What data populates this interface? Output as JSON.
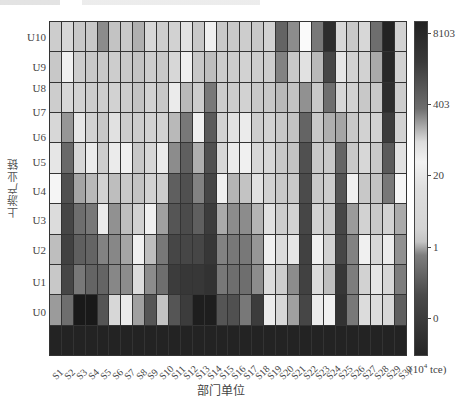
{
  "chart_data": {
    "type": "heatmap",
    "title": "",
    "xlabel": "部门单位",
    "ylabel": "上游产业链",
    "colorbar": {
      "unit": "(10⁴ tce)",
      "ticks": [
        "8103",
        "403",
        "20",
        "1",
        "0"
      ],
      "gradient": [
        {
          "pos": 0,
          "color": "#222222"
        },
        {
          "pos": 0.12,
          "color": "#3a3a3a"
        },
        {
          "pos": 0.26,
          "color": "#6e6e6e"
        },
        {
          "pos": 0.36,
          "color": "#dcdcdc"
        },
        {
          "pos": 0.42,
          "color": "#f2f2f2"
        },
        {
          "pos": 0.5,
          "color": "#dedede"
        },
        {
          "pos": 0.62,
          "color": "#d4d4d4"
        },
        {
          "pos": 0.66,
          "color": "#c4c4c4"
        },
        {
          "pos": 0.7,
          "color": "#7e7e7e"
        },
        {
          "pos": 0.82,
          "color": "#4a4a4a"
        },
        {
          "pos": 1,
          "color": "#252525"
        }
      ]
    },
    "x_categories": [
      "S1",
      "S2",
      "S3",
      "S4",
      "S5",
      "S6",
      "S7",
      "S8",
      "S9",
      "S10",
      "S11",
      "S12",
      "S13",
      "S14",
      "S15",
      "S16",
      "S17",
      "S18",
      "S19",
      "S20",
      "S21",
      "S22",
      "S23",
      "S24",
      "S25",
      "S26",
      "S27",
      "S28",
      "S29",
      "S30"
    ],
    "y_categories": [
      "U10",
      "U9",
      "U8",
      "U7",
      "U6",
      "U5",
      "U4",
      "U3",
      "U2",
      "U1",
      "U0"
    ],
    "cell_grey_levels_note": "rows top-to-bottom (11 grid bands, last band all dark), values are grey level 0-255",
    "grey_levels": [
      [
        205,
        215,
        200,
        200,
        140,
        195,
        200,
        175,
        215,
        205,
        210,
        225,
        200,
        240,
        200,
        200,
        205,
        200,
        210,
        100,
        140,
        250,
        120,
        45,
        215,
        200,
        215,
        110,
        35,
        210
      ],
      [
        200,
        240,
        205,
        200,
        200,
        205,
        200,
        195,
        205,
        200,
        215,
        240,
        200,
        190,
        205,
        205,
        210,
        205,
        205,
        130,
        200,
        225,
        185,
        70,
        230,
        210,
        210,
        170,
        40,
        210
      ],
      [
        205,
        215,
        210,
        205,
        205,
        210,
        205,
        195,
        210,
        200,
        235,
        185,
        205,
        120,
        205,
        205,
        210,
        200,
        200,
        185,
        195,
        145,
        200,
        110,
        215,
        210,
        200,
        200,
        45,
        205
      ],
      [
        215,
        150,
        230,
        210,
        200,
        225,
        205,
        205,
        210,
        210,
        185,
        120,
        240,
        90,
        210,
        225,
        235,
        205,
        210,
        200,
        195,
        100,
        200,
        175,
        165,
        200,
        210,
        210,
        60,
        210
      ],
      [
        230,
        105,
        215,
        235,
        205,
        235,
        240,
        200,
        215,
        235,
        140,
        95,
        175,
        80,
        215,
        235,
        240,
        215,
        215,
        200,
        195,
        80,
        200,
        200,
        100,
        200,
        215,
        200,
        90,
        225
      ],
      [
        245,
        80,
        165,
        185,
        210,
        190,
        200,
        195,
        210,
        205,
        95,
        80,
        130,
        70,
        240,
        180,
        195,
        225,
        210,
        200,
        200,
        75,
        200,
        205,
        85,
        240,
        200,
        195,
        120,
        245
      ],
      [
        220,
        70,
        110,
        120,
        235,
        145,
        190,
        210,
        240,
        160,
        85,
        75,
        95,
        60,
        170,
        140,
        140,
        180,
        225,
        205,
        210,
        70,
        210,
        200,
        70,
        155,
        210,
        200,
        210,
        170
      ],
      [
        190,
        65,
        95,
        100,
        130,
        135,
        165,
        240,
        190,
        120,
        70,
        70,
        70,
        55,
        130,
        120,
        120,
        150,
        240,
        220,
        230,
        65,
        240,
        210,
        70,
        130,
        240,
        215,
        235,
        145
      ],
      [
        200,
        70,
        120,
        100,
        100,
        135,
        140,
        220,
        140,
        110,
        60,
        55,
        55,
        50,
        120,
        110,
        110,
        140,
        220,
        205,
        140,
        65,
        220,
        190,
        55,
        125,
        210,
        230,
        215,
        125
      ],
      [
        155,
        110,
        25,
        25,
        85,
        215,
        235,
        160,
        85,
        195,
        85,
        60,
        30,
        30,
        85,
        80,
        120,
        60,
        235,
        215,
        160,
        70,
        235,
        240,
        50,
        120,
        220,
        220,
        215,
        95
      ],
      [
        35,
        35,
        35,
        35,
        35,
        35,
        35,
        35,
        35,
        35,
        35,
        35,
        35,
        35,
        35,
        35,
        35,
        35,
        35,
        35,
        35,
        35,
        35,
        35,
        35,
        35,
        35,
        35,
        35,
        35
      ]
    ]
  },
  "y_label_positions": [
    37,
    67,
    88,
    112,
    137,
    162,
    191,
    220,
    250,
    282,
    312
  ],
  "cbar_tick_positions": [
    33,
    104,
    175,
    247,
    318
  ]
}
